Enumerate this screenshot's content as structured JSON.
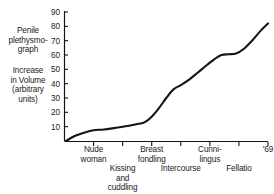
{
  "chart_data": {
    "type": "line",
    "title": "",
    "xlabel": "",
    "ylabel": "Increase in Volume (arbitrary units)",
    "ylim": [
      0,
      90
    ],
    "xlim": [
      0,
      7
    ],
    "grid": false,
    "legend": null,
    "y_ticks": [
      10,
      20,
      30,
      40,
      50,
      60,
      70,
      80,
      90
    ],
    "x_ticks": [
      1,
      2,
      3,
      4,
      5,
      6,
      7
    ],
    "categories": [
      "Nude woman",
      "Kissing and cuddling",
      "Breast fondling",
      "Intercourse",
      "Cunni- lingus",
      "Fellatio",
      "'69"
    ],
    "series": [
      {
        "name": "Penile plethysmograph response",
        "x": [
          0.05,
          0.35,
          0.7,
          1.0,
          1.35,
          1.7,
          2.0,
          2.3,
          2.55,
          2.75,
          3.0,
          3.25,
          3.5,
          3.75,
          4.0,
          4.3,
          4.6,
          4.9,
          5.15,
          5.4,
          5.65,
          5.9,
          6.15,
          6.45,
          6.75,
          7.0
        ],
        "values": [
          0,
          3.5,
          6,
          7.5,
          8,
          9,
          10,
          11,
          12,
          13,
          17,
          23,
          30,
          36,
          39,
          43,
          48,
          53,
          57,
          60,
          60.5,
          61,
          64,
          70,
          77,
          82
        ]
      }
    ]
  },
  "axis_captions": {
    "instrument": "Penile\nplethysmo-\ngraph",
    "measure": "Increase\nin Volume\n(arbitrary\nunits)"
  },
  "x_labels": [
    {
      "text": "Nude\nwoman",
      "row": "upper"
    },
    {
      "text": "Kissing\nand\ncuddling",
      "row": "lower"
    },
    {
      "text": "Breast\nfondling",
      "row": "upper"
    },
    {
      "text": "Intercourse",
      "row": "lower"
    },
    {
      "text": "Cunni-\nlingus",
      "row": "upper"
    },
    {
      "text": "Fellatio",
      "row": "lower"
    },
    {
      "text": "'69",
      "row": "upper"
    }
  ],
  "style": {
    "line_color": "#141414",
    "axis_color": "#141414",
    "background": "#ffffff"
  }
}
